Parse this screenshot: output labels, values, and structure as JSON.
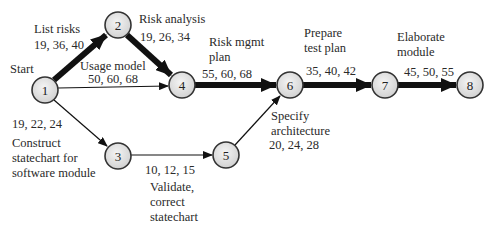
{
  "diagram": {
    "type": "PERT activity network",
    "nodes": [
      {
        "id": "1",
        "label": "1",
        "x": 45,
        "y": 90
      },
      {
        "id": "2",
        "label": "2",
        "x": 118,
        "y": 25
      },
      {
        "id": "3",
        "label": "3",
        "x": 118,
        "y": 156
      },
      {
        "id": "4",
        "label": "4",
        "x": 182,
        "y": 85
      },
      {
        "id": "5",
        "label": "5",
        "x": 226,
        "y": 155
      },
      {
        "id": "6",
        "label": "6",
        "x": 290,
        "y": 85
      },
      {
        "id": "7",
        "label": "7",
        "x": 385,
        "y": 85
      },
      {
        "id": "8",
        "label": "8",
        "x": 470,
        "y": 85
      }
    ],
    "start_label": "Start",
    "edges": [
      {
        "from": "1",
        "to": "2",
        "activity": "List risks",
        "estimates": "19, 36, 40",
        "critical": true
      },
      {
        "from": "2",
        "to": "4",
        "activity": "Risk analysis",
        "estimates": "19, 26, 34",
        "critical": true
      },
      {
        "from": "1",
        "to": "4",
        "activity": "Usage model",
        "estimates": "50, 60, 68",
        "critical": false
      },
      {
        "from": "1",
        "to": "3",
        "activity": "Construct statechart for software module",
        "estimates": "19, 22, 24",
        "critical": false
      },
      {
        "from": "3",
        "to": "5",
        "activity": "Validate, correct statechart",
        "estimates": "10, 12, 15",
        "critical": false
      },
      {
        "from": "5",
        "to": "6",
        "activity": "Specify architecture",
        "estimates": "20, 24, 28",
        "critical": false
      },
      {
        "from": "4",
        "to": "6",
        "activity": "Risk mgmt plan",
        "estimates": "55, 60, 68",
        "critical": true
      },
      {
        "from": "6",
        "to": "7",
        "activity": "Prepare test plan",
        "estimates": "35, 40, 42",
        "critical": true
      },
      {
        "from": "7",
        "to": "8",
        "activity": "Elaborate module",
        "estimates": "45, 50, 55",
        "critical": true
      }
    ],
    "labels": {
      "start": "Start",
      "list_risks": "List risks",
      "list_risks_est": "19, 36, 40",
      "risk_analysis": "Risk analysis",
      "risk_analysis_est": "19, 26, 34",
      "usage_model": "Usage model",
      "usage_model_est": "50, 60, 68",
      "risk_mgmt": "Risk mgmt\nplan",
      "risk_mgmt_est": "55, 60, 68",
      "prepare_test": "Prepare\ntest plan",
      "prepare_test_est": "35, 40, 42",
      "elaborate": "Elaborate\nmodule",
      "elaborate_est": "45, 50, 55",
      "construct_est": "19, 22, 24",
      "construct": "Construct\nstatechart for\nsoftware module",
      "validate_est": "10, 12, 15",
      "validate": "Validate,\ncorrect\nstatechart",
      "specify": "Specify\narchitecture",
      "specify_est": "20, 24, 28"
    },
    "colors": {
      "node_fill": "#e4e4e4",
      "node_stroke": "#333333",
      "edge": "#111111",
      "text": "#2a2a2a"
    }
  }
}
